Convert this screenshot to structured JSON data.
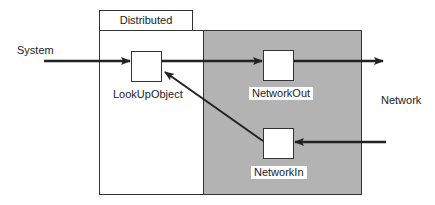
{
  "diagram": {
    "container": {
      "tab_label": "Distributed"
    },
    "external_labels": {
      "left": "System",
      "right": "Network"
    },
    "nodes": [
      {
        "id": "lookup",
        "label": "LookUpObject"
      },
      {
        "id": "netout",
        "label": "NetworkOut"
      },
      {
        "id": "netin",
        "label": "NetworkIn"
      }
    ],
    "edges": [
      {
        "from": "System",
        "to": "LookUpObject"
      },
      {
        "from": "LookUpObject",
        "to": "NetworkOut"
      },
      {
        "from": "NetworkOut",
        "to": "Network"
      },
      {
        "from": "Network",
        "to": "NetworkIn"
      },
      {
        "from": "NetworkIn",
        "to": "LookUpObject"
      }
    ],
    "colors": {
      "shaded_region": "#b3b3b3",
      "stroke": "#222222",
      "node_fill": "#ffffff"
    }
  }
}
